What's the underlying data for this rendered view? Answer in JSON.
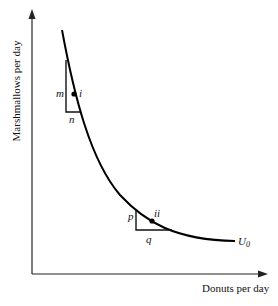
{
  "diagram": {
    "title": "",
    "axes": {
      "y_label": "Marshmallows per day",
      "x_label": "Donuts per day"
    },
    "curve": {
      "label": "U",
      "label_sub": "0",
      "color": "#000000"
    },
    "points": [
      {
        "id": "i",
        "label": "i"
      },
      {
        "id": "ii",
        "label": "ii"
      }
    ],
    "triangles": [
      {
        "vertical_label": "m",
        "horizontal_label": "n"
      },
      {
        "vertical_label": "p",
        "horizontal_label": "q"
      }
    ]
  }
}
